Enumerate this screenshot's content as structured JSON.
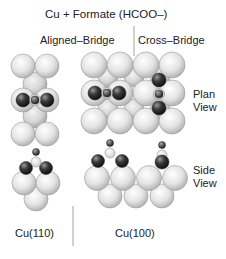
{
  "title": "Cu + Formate (HCOO–)",
  "columns": {
    "aligned": "Aligned–Bridge",
    "cross": "Cross–Bridge"
  },
  "views": {
    "plan_line1": "Plan",
    "plan_line2": "View",
    "side_line1": "Side",
    "side_line2": "View"
  },
  "surfaces": {
    "cu110": "Cu(110)",
    "cu100": "Cu(100)"
  },
  "colors": {
    "cu_light": "#e8e8e8",
    "cu_shade": "#b0b0b0",
    "oxygen_dark": "#2a2a2a",
    "carbon_small": "#555555",
    "hydrogen_light": "#f0f0f0"
  }
}
